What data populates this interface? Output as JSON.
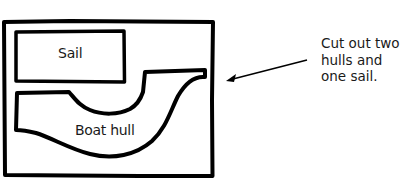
{
  "diagram": {
    "pieces": {
      "sail": {
        "label": "Sail"
      },
      "hull": {
        "label": "Boat hull"
      }
    },
    "annotation": {
      "lines": [
        "Cut out two",
        "hulls and",
        "one sail."
      ]
    },
    "colors": {
      "stroke": "#000000",
      "text": "#1a1a1a",
      "background": "#ffffff"
    }
  }
}
